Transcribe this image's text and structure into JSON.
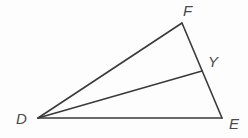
{
  "figure": {
    "kind": "geometry-diagram",
    "canvas": {
      "width": 248,
      "height": 138,
      "background": "#fdfdfd"
    },
    "style": {
      "stroke_color": "#3a3a3a",
      "stroke_width": 1.6,
      "label_color": "#4a4a4a",
      "label_font_size": 15
    },
    "points": [
      {
        "id": "F",
        "label": "F",
        "x": 182,
        "y": 23
      },
      {
        "id": "Y",
        "label": "Y",
        "x": 202,
        "y": 71
      },
      {
        "id": "D",
        "label": "D",
        "x": 38,
        "y": 118
      },
      {
        "id": "E",
        "label": "E",
        "x": 222,
        "y": 118
      }
    ],
    "segments": [
      {
        "id": "DF",
        "from": "D",
        "to": "F"
      },
      {
        "id": "FE",
        "from": "F",
        "to": "E"
      },
      {
        "id": "DE",
        "from": "D",
        "to": "E"
      },
      {
        "id": "DY",
        "from": "D",
        "to": "Y"
      }
    ],
    "labels": {
      "F": "F",
      "Y": "Y",
      "D": "D",
      "E": "E"
    }
  }
}
